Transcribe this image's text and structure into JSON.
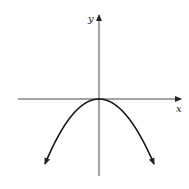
{
  "diagram": {
    "type": "graph",
    "axes": {
      "x_label": "x",
      "y_label": "y"
    },
    "curve": {
      "shape": "parabola",
      "opens": "down",
      "vertex": "origin",
      "arrows_at_ends": true
    },
    "colors": {
      "stroke": "#222222",
      "background": "#ffffff"
    }
  }
}
